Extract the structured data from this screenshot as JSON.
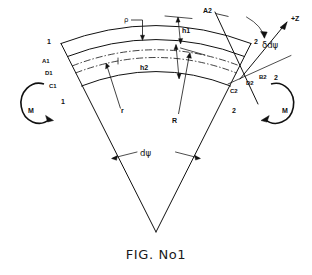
{
  "figure": {
    "caption": "FIG. No1",
    "ink_color": "#111111",
    "background_color": "#ffffff"
  },
  "labels": {
    "left_outer_corner": "1",
    "left_A": "A1",
    "left_D": "D1",
    "left_C": "C1",
    "left_inner_corner": "1",
    "right_C": "C2",
    "right_D": "D2",
    "right_B": "B2",
    "right_outer_corner": "2",
    "right_inner_corner": "2",
    "top_section_A2": "A2",
    "rho": "ρ",
    "axis_z": "+Z",
    "rotation": "δdψ",
    "height_outer": "h1",
    "height_inner": "h2",
    "radius_inner": "r",
    "radius_outer": "R",
    "sector_angle": "dψ",
    "moment_left": "M",
    "moment_right": "M"
  },
  "geometry_notes": {
    "type": "engineering-line-drawing",
    "apex": {
      "x": 156,
      "y": 232
    },
    "sector_half_angle_deg": 27,
    "arcs": [
      {
        "name": "outer-edge",
        "style": "solid"
      },
      {
        "name": "upper-intermediate",
        "style": "solid"
      },
      {
        "name": "neutral-axis-upper",
        "style": "dash-dot"
      },
      {
        "name": "neutral-axis-lower",
        "style": "dash-dot"
      },
      {
        "name": "inner-edge",
        "style": "solid"
      }
    ],
    "moment_arrow_direction": {
      "left": "clockwise",
      "right": "counter-clockwise"
    }
  }
}
